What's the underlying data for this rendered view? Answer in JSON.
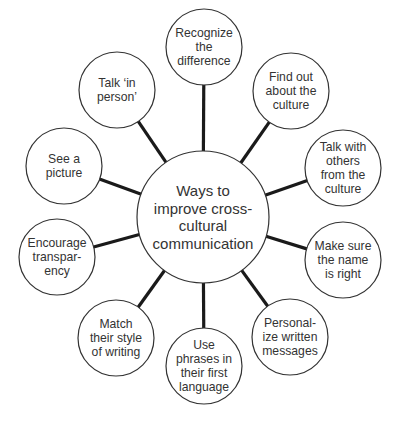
{
  "diagram": {
    "type": "mind-map",
    "center": {
      "label_lines": [
        "Ways to",
        "improve cross-",
        "cultural",
        "communication"
      ],
      "cx": 203,
      "cy": 217,
      "r": 66
    },
    "nodes": [
      {
        "id": "recognize",
        "label_lines": [
          "Recognize",
          "the",
          "difference"
        ],
        "cx": 204,
        "cy": 47
      },
      {
        "id": "find-out",
        "label_lines": [
          "Find out",
          "about the",
          "culture"
        ],
        "cx": 291,
        "cy": 91
      },
      {
        "id": "talk-with-others",
        "label_lines": [
          "Talk with",
          "others",
          "from the",
          "culture"
        ],
        "cx": 343,
        "cy": 168
      },
      {
        "id": "make-sure-name",
        "label_lines": [
          "Make sure",
          "the name",
          "is right"
        ],
        "cx": 343,
        "cy": 260
      },
      {
        "id": "personalize",
        "label_lines": [
          "Personal-",
          "ize written",
          "messages"
        ],
        "cx": 290,
        "cy": 337
      },
      {
        "id": "use-phrases",
        "label_lines": [
          "Use",
          "phrases in",
          "their first",
          "language"
        ],
        "cx": 204,
        "cy": 366
      },
      {
        "id": "match-style",
        "label_lines": [
          "Match",
          "their style",
          "of writing"
        ],
        "cx": 116,
        "cy": 338
      },
      {
        "id": "encourage-transparency",
        "label_lines": [
          "Encourage",
          "transpar-",
          "ency"
        ],
        "cx": 57,
        "cy": 257
      },
      {
        "id": "see-picture",
        "label_lines": [
          "See a",
          "picture"
        ],
        "cx": 64,
        "cy": 166
      },
      {
        "id": "talk-in-person",
        "label_lines": [
          "Talk ‘in",
          "person’"
        ],
        "cx": 117,
        "cy": 90
      }
    ],
    "node_radius": 38,
    "colors": {
      "stroke": "#333333",
      "spoke": "#1a1a1a",
      "text": "#333333",
      "background": "#ffffff"
    }
  }
}
